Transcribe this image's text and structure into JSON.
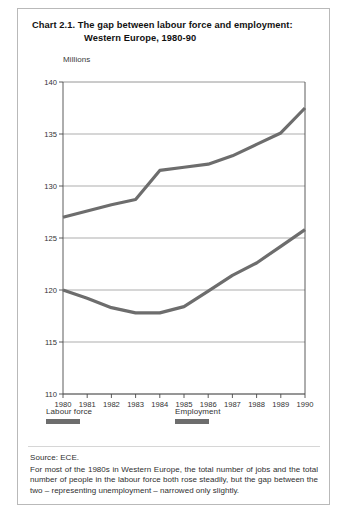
{
  "figure": {
    "title_line_1": "Chart 2.1.  The gap between labour force and employment:",
    "title_line_2": "Western Europe, 1980-90",
    "unit_label": "Millions",
    "source": "Source: ECE.",
    "note": "For most of the 1980s in Western Europe, the total number of jobs and the total number of people in the labour force both rose steadily, but the gap between the two – representing unemployment – narrowed only slightly.",
    "line_color": "#6d6d6d",
    "grid_color": "#8a8a8a",
    "axis_color": "#4a4a4a"
  },
  "chart_data": {
    "type": "line",
    "title": "Chart 2.1. The gap between labour force and employment: Western Europe, 1980-90",
    "xlabel": "",
    "ylabel": "Millions",
    "ylim": [
      110,
      140
    ],
    "yticks": [
      110,
      115,
      120,
      125,
      130,
      135,
      140
    ],
    "xlim": [
      1980,
      1990
    ],
    "categories": [
      1980,
      1981,
      1982,
      1983,
      1984,
      1985,
      1986,
      1987,
      1988,
      1989,
      1990
    ],
    "x_tick_labels": [
      "1980",
      "1981",
      "1982",
      "1983",
      "1984",
      "1985",
      "1986",
      "1987",
      "1988",
      "1989",
      "1990"
    ],
    "grid": true,
    "legend_position": "below-axes",
    "series": [
      {
        "name": "Labour force",
        "color": "#6d6d6d",
        "values": [
          127.0,
          127.6,
          128.2,
          128.7,
          131.5,
          131.8,
          132.1,
          132.9,
          134.0,
          135.1,
          137.5
        ]
      },
      {
        "name": "Employment",
        "color": "#6d6d6d",
        "values": [
          120.0,
          119.2,
          118.3,
          117.8,
          117.8,
          118.4,
          119.9,
          121.4,
          122.6,
          124.2,
          125.8
        ]
      }
    ]
  },
  "legend": {
    "items": [
      {
        "label": "Labour force"
      },
      {
        "label": "Employment"
      }
    ]
  }
}
